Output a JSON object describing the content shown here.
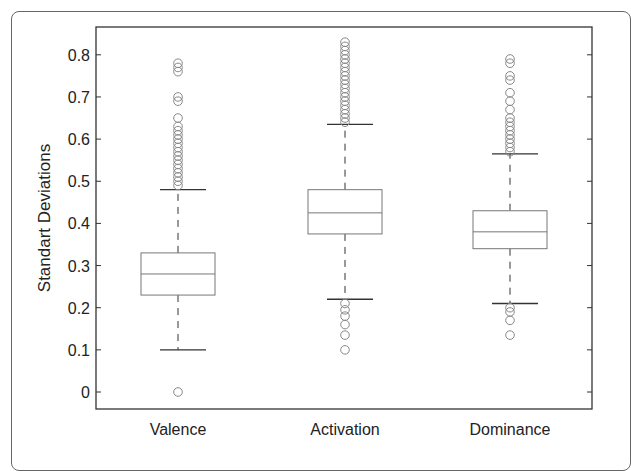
{
  "chart_data": {
    "type": "box",
    "title": "",
    "xlabel": "",
    "ylabel": "Standart Deviations",
    "ylim": [
      -0.03,
      0.86
    ],
    "yticks": [
      0,
      0.1,
      0.2,
      0.3,
      0.4,
      0.5,
      0.6,
      0.7,
      0.8
    ],
    "ytick_labels": [
      "0",
      "0.1",
      "0.2",
      "0.3",
      "0.4",
      "0.5",
      "0.6",
      "0.7",
      "0.8"
    ],
    "grid": false,
    "legend": null,
    "categories": [
      "Valence",
      "Activation",
      "Dominance"
    ],
    "series": [
      {
        "name": "Valence",
        "whisker_low": 0.1,
        "q1": 0.23,
        "median": 0.28,
        "q3": 0.33,
        "whisker_high": 0.48,
        "outliers": [
          0.0,
          0.49,
          0.5,
          0.51,
          0.52,
          0.53,
          0.54,
          0.55,
          0.56,
          0.57,
          0.58,
          0.59,
          0.6,
          0.61,
          0.62,
          0.63,
          0.65,
          0.69,
          0.7,
          0.76,
          0.77,
          0.78
        ]
      },
      {
        "name": "Activation",
        "whisker_low": 0.22,
        "q1": 0.375,
        "median": 0.425,
        "q3": 0.48,
        "whisker_high": 0.635,
        "outliers": [
          0.1,
          0.135,
          0.16,
          0.18,
          0.195,
          0.21,
          0.64,
          0.65,
          0.66,
          0.67,
          0.68,
          0.69,
          0.7,
          0.71,
          0.72,
          0.73,
          0.74,
          0.75,
          0.76,
          0.77,
          0.78,
          0.79,
          0.8,
          0.81,
          0.82,
          0.83
        ]
      },
      {
        "name": "Dominance",
        "whisker_low": 0.21,
        "q1": 0.34,
        "median": 0.38,
        "q3": 0.43,
        "whisker_high": 0.565,
        "outliers": [
          0.135,
          0.17,
          0.19,
          0.2,
          0.57,
          0.58,
          0.59,
          0.6,
          0.61,
          0.62,
          0.63,
          0.64,
          0.65,
          0.67,
          0.69,
          0.71,
          0.74,
          0.75,
          0.78,
          0.79
        ]
      }
    ]
  },
  "colors": {
    "box": "#777777",
    "whisker": "#333333",
    "outlier": "#888888",
    "axis": "#333333"
  }
}
